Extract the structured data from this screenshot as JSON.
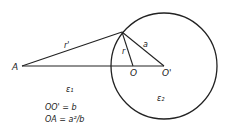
{
  "diagram": {
    "points": {
      "A": {
        "label": "A",
        "x": 18,
        "y": 66
      },
      "O": {
        "label": "O",
        "x": 133,
        "y": 66
      },
      "O_prime": {
        "label": "O'",
        "x": 164,
        "y": 66
      },
      "P": {
        "x": 122,
        "y": 32
      }
    },
    "circle": {
      "cx": 164,
      "cy": 66,
      "r": 53
    },
    "segments": {
      "r_prime": {
        "label": "r'"
      },
      "r": {
        "label": "r"
      },
      "a": {
        "label": "a"
      }
    },
    "regions": {
      "eps1": {
        "label": "ε₁"
      },
      "eps2": {
        "label": "ε₂"
      }
    },
    "equations": [
      "OO' = b",
      "OA = a²/b"
    ]
  }
}
